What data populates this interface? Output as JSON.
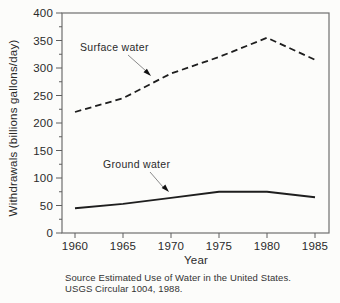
{
  "figure": {
    "source_note": [
      "Source Estimated Use of Water in the United States.",
      "USGS Circular 1004, 1988."
    ]
  },
  "annotations": [
    {
      "text": "Surface water",
      "target_series": "Surface water"
    },
    {
      "text": "Ground water",
      "target_series": "Ground water"
    }
  ],
  "chart_data": {
    "type": "line",
    "title": "",
    "xlabel": "Year",
    "ylabel": "Withdrawals (billions gallons/day)",
    "x": [
      1960,
      1965,
      1970,
      1975,
      1980,
      1985
    ],
    "x_tick_labels": [
      "1960",
      "1965",
      "1970",
      "1975",
      "1980",
      "1985"
    ],
    "series": [
      {
        "name": "Surface water",
        "line_style": "dashed",
        "values": [
          220,
          245,
          290,
          320,
          355,
          315
        ]
      },
      {
        "name": "Ground water",
        "line_style": "solid",
        "values": [
          45,
          53,
          64,
          75,
          75,
          65
        ]
      }
    ],
    "xlim": [
      1960,
      1985
    ],
    "ylim": [
      0,
      400
    ],
    "y_tick_step": 50,
    "y_minor_tick_step": 25,
    "grid": false,
    "legend": "inline-annotations",
    "colors": {
      "line": "#1e1e1e",
      "frame": "#6e6e6e",
      "text": "#2a2a2a"
    }
  }
}
